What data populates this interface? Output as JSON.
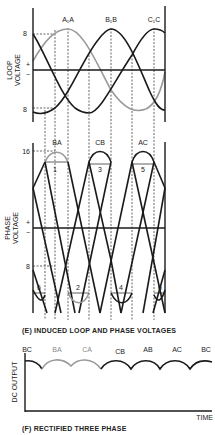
{
  "colors": {
    "ink": "#1a1a1a",
    "gray_curve": "#9a9a9a",
    "background": "#ffffff"
  },
  "loop_voltage": {
    "axis_label_line1": "LOOP",
    "axis_label_line2": "VOLTAGE",
    "plus": "+",
    "minus": "−",
    "tick_top": "8",
    "tick_bottom": "8",
    "peak_labels": [
      "A₁A",
      "B₁B",
      "C₁C"
    ]
  },
  "phase_voltage": {
    "axis_label_line1": "PHASE",
    "axis_label_line2": "VOLTAGE",
    "plus": "+",
    "minus": "−",
    "tick_top": "16",
    "tick_mid": "8",
    "top_peak_labels": [
      "BA",
      "CB",
      "AC"
    ],
    "top_interval_numbers": [
      "1",
      "3",
      "5"
    ],
    "bottom_interval_numbers": [
      "6",
      "2",
      "4",
      "6"
    ]
  },
  "caption_e": "(E) INDUCED LOOP AND PHASE VOLTAGES",
  "dc_output": {
    "axis_label": "DC OUTPUT",
    "x_label": "TIME",
    "segment_labels": [
      "BC",
      "BA",
      "CA",
      "CB",
      "AB",
      "AC",
      "BC"
    ],
    "gray_segments": [
      "BA",
      "CA"
    ]
  },
  "caption_f": "(F) RECTIFIED THREE PHASE"
}
